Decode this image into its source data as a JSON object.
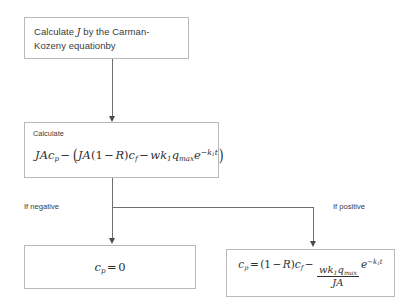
{
  "diagram": {
    "nodes": {
      "carman_kozeny": {
        "text": "Calculate J by the Carman-Kozeny equationby",
        "line1_pre": "Calculate ",
        "line1_var": "J",
        "line1_post": " by the Carman-",
        "line2": "Kozeny equationby"
      },
      "calculate": {
        "label": "Calculate",
        "equation": "JAc_p − (JA(1 − R)c_f − w k_1 q_max e^(−k_1 t))",
        "terms": {
          "t1_J": "J",
          "t1_A": "A",
          "t1_c": "c",
          "t1_c_sub": "p",
          "minus": "−",
          "open_paren": "(",
          "t2_J": "J",
          "t2_A": "A",
          "t2_open": "(",
          "t2_one": "1",
          "t2_minus": "−",
          "t2_R": "R",
          "t2_close": ")",
          "t2_c": "c",
          "t2_c_sub": "f",
          "t3_w": "w",
          "t3_k": "k",
          "t3_k_sub": "1",
          "t3_q": "q",
          "t3_q_sub": "max",
          "t3_e": "e",
          "t3_exp_minus": "−",
          "t3_exp_k": "k",
          "t3_exp_k_sub": "1",
          "t3_exp_t": "t",
          "close_paren": ")"
        }
      },
      "cp_zero": {
        "equation": "c_p = 0",
        "terms": {
          "c": "c",
          "c_sub": "p",
          "equals": "=",
          "zero": "0"
        }
      },
      "cp_full": {
        "equation": "c_p = (1 − R)c_f − (w k_1 q_max / JA) e^(−k_1 t)",
        "terms": {
          "c": "c",
          "c_sub": "p",
          "equals": "=",
          "open": "(",
          "one": "1",
          "minus1": "−",
          "R": "R",
          "close": ")",
          "cf": "c",
          "cf_sub": "f",
          "minus2": "−",
          "num_w": "w",
          "num_k": "k",
          "num_k_sub": "1",
          "num_q": "q",
          "num_q_sub": "max",
          "den_J": "J",
          "den_A": "A",
          "e": "e",
          "exp_minus": "−",
          "exp_k": "k",
          "exp_k_sub": "1",
          "exp_t": "t"
        }
      }
    },
    "branch_labels": {
      "negative": "If negative",
      "positive": "If positive"
    },
    "colors": {
      "box_border": "#b9b9b9",
      "connector": "#6f6f6f",
      "arrowhead": "#4a4a4a",
      "text": "#3b3b3b",
      "math_text": "#2f2f2f",
      "background": "#ffffff"
    }
  }
}
